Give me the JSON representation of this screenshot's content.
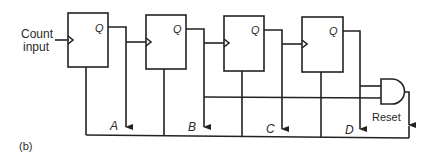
{
  "diagram": {
    "type": "ripple counter with reset",
    "input_label_line1": "Count",
    "input_label_line2": "input",
    "flipflops": [
      {
        "id": "ff1",
        "output_label": "Q",
        "tap_label": "A"
      },
      {
        "id": "ff2",
        "output_label": "Q",
        "tap_label": "B"
      },
      {
        "id": "ff3",
        "output_label": "Q",
        "tap_label": "C"
      },
      {
        "id": "ff4",
        "output_label": "Q",
        "tap_label": "D"
      }
    ],
    "gate": {
      "type": "AND",
      "label": "Reset"
    },
    "caption": "(b)"
  }
}
